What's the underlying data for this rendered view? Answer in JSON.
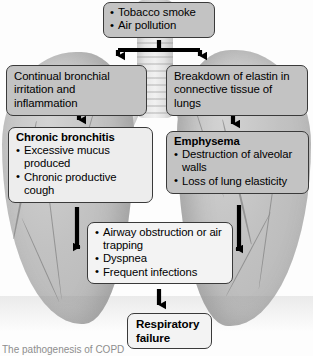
{
  "diagram": {
    "background_art": "lung-anatomy-illustration",
    "nodes": {
      "cause": {
        "items": [
          "Tobacco smoke",
          "Air pollution"
        ],
        "fill": "#c3c3c3"
      },
      "bronchial_irritation": {
        "text": "Continual bronchial irritation and inflammation",
        "fill": "#c3c3c3"
      },
      "elastin_breakdown": {
        "text": "Breakdown of elastin in connective tissue of lungs",
        "fill": "#c3c3c3"
      },
      "chronic_bronchitis": {
        "heading": "Chronic bronchitis",
        "items": [
          "Excessive mucus produced",
          "Chronic productive cough"
        ],
        "fill": "#ededed"
      },
      "emphysema": {
        "heading": "Emphysema",
        "items": [
          "Destruction of alveolar walls",
          "Loss of lung elasticity"
        ],
        "fill": "#c3c3c3"
      },
      "obstruction": {
        "items": [
          "Airway obstruction or air trapping",
          "Dyspnea",
          "Frequent infections"
        ],
        "fill": "#f3f3f3"
      },
      "respiratory_failure": {
        "text": "Respiratory failure",
        "fill": "#f3f3f3"
      }
    },
    "arrows": [
      {
        "name": "cause-split-to-both",
        "from": "cause",
        "to": [
          "bronchial_irritation",
          "elastin_breakdown"
        ],
        "style": "tee-split"
      },
      {
        "name": "bronchial-to-bronchitis",
        "from": "bronchial_irritation",
        "to": "chronic_bronchitis",
        "style": "vertical"
      },
      {
        "name": "elastin-to-emphysema",
        "from": "elastin_breakdown",
        "to": "emphysema",
        "style": "vertical"
      },
      {
        "name": "bronchitis-to-obstruction",
        "from": "chronic_bronchitis",
        "to": "obstruction",
        "style": "elbow-right"
      },
      {
        "name": "emphysema-to-obstruction",
        "from": "emphysema",
        "to": "obstruction",
        "style": "elbow-left"
      },
      {
        "name": "obstruction-to-failure",
        "from": "obstruction",
        "to": "respiratory_failure",
        "style": "vertical"
      }
    ],
    "colors": {
      "arrow": "#000000",
      "box_border": "#3a3a3a",
      "box_gray": "#c3c3c3",
      "box_light": "#ededed",
      "text": "#000000"
    }
  },
  "caption": {
    "text": "The pathogenesis of COPD"
  }
}
